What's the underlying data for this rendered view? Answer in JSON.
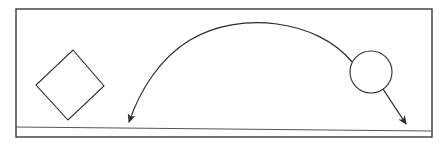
{
  "diagram": {
    "colors": {
      "stroke": "#2b2b2b",
      "ground": "#555555",
      "background": "#ffffff"
    },
    "frame": {
      "x": 16,
      "y": 9,
      "width": 416,
      "height": 128
    },
    "ground_line": {
      "x1": 16,
      "y1": 127,
      "x2": 432,
      "y2": 131
    },
    "shapes": [
      {
        "kind": "diamond",
        "name": "diamond-object",
        "points": [
          [
            73,
            50
          ],
          [
            104,
            86
          ],
          [
            68,
            120
          ],
          [
            36,
            85
          ]
        ]
      },
      {
        "kind": "circle",
        "name": "circle-object",
        "cx": 371,
        "cy": 72,
        "r": 21
      }
    ],
    "arrows": [
      {
        "name": "arc-trajectory-arrow",
        "path": "M 352 62 C 318 20, 240 10, 190 40 C 160 58, 140 90, 129 122",
        "tip": [
          128,
          122
        ]
      },
      {
        "name": "drop-arrow",
        "path": "M 383 89 L 406 124",
        "tip": [
          407,
          126
        ]
      }
    ]
  }
}
